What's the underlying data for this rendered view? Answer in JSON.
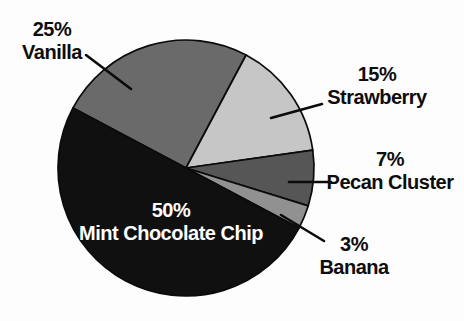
{
  "page": {
    "background": "#fdfdfd",
    "label_text_color": "#0d0d0d",
    "inside_label_text_color": "#ffffff",
    "outline_color": "#0b0b0b"
  },
  "chart_data": {
    "type": "pie",
    "title": "",
    "legend_position": "none",
    "labels_style": "external callout labels with percentage, largest slice labeled inside",
    "start_angle_deg": 152,
    "direction": "clockwise",
    "geometry": {
      "cx": 186,
      "cy": 168,
      "r": 128
    },
    "categories": [
      "Vanilla",
      "Strawberry",
      "Pecan Cluster",
      "Banana",
      "Mint Chocolate Chip"
    ],
    "values": [
      25,
      15,
      7,
      3,
      50
    ],
    "slices": [
      {
        "label": "Vanilla",
        "pct": 25,
        "pct_text": "25%",
        "color": "#6a6a6a"
      },
      {
        "label": "Strawberry",
        "pct": 15,
        "pct_text": "15%",
        "color": "#c6c6c6"
      },
      {
        "label": "Pecan Cluster",
        "pct": 7,
        "pct_text": "7%",
        "color": "#565656"
      },
      {
        "label": "Banana",
        "pct": 3,
        "pct_text": "3%",
        "color": "#919191"
      },
      {
        "label": "Mint Chocolate Chip",
        "pct": 50,
        "pct_text": "50%",
        "color": "#101010"
      }
    ],
    "leader_lines": [
      {
        "for": "Vanilla",
        "x1": 86,
        "y1": 55,
        "x2": 131,
        "y2": 89
      },
      {
        "for": "Strawberry",
        "x1": 322,
        "y1": 104,
        "x2": 271,
        "y2": 118
      },
      {
        "for": "Pecan Cluster",
        "x1": 331,
        "y1": 182,
        "x2": 289,
        "y2": 182
      },
      {
        "for": "Banana",
        "x1": 324,
        "y1": 241,
        "x2": 281,
        "y2": 215
      }
    ]
  }
}
